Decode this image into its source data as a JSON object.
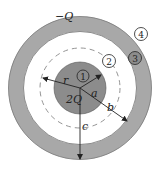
{
  "diagram": {
    "title": "",
    "labels": {
      "outer_charge": "−Q",
      "inner_charge": "2Q",
      "radius_r": "r",
      "radius_a": "a",
      "radius_b": "b",
      "radius_c": "c"
    },
    "regions": [
      {
        "id": "1",
        "label": "1",
        "description": "inside inner sphere"
      },
      {
        "id": "2",
        "label": "2",
        "description": "between sphere and shell"
      },
      {
        "id": "3",
        "label": "3",
        "description": "within conducting shell"
      },
      {
        "id": "4",
        "label": "4",
        "description": "outside shell"
      }
    ],
    "colors": {
      "shell": "#a8a8a8",
      "sphere": "#8c8c8c",
      "line": "#222222",
      "dashed": "#888888"
    }
  }
}
